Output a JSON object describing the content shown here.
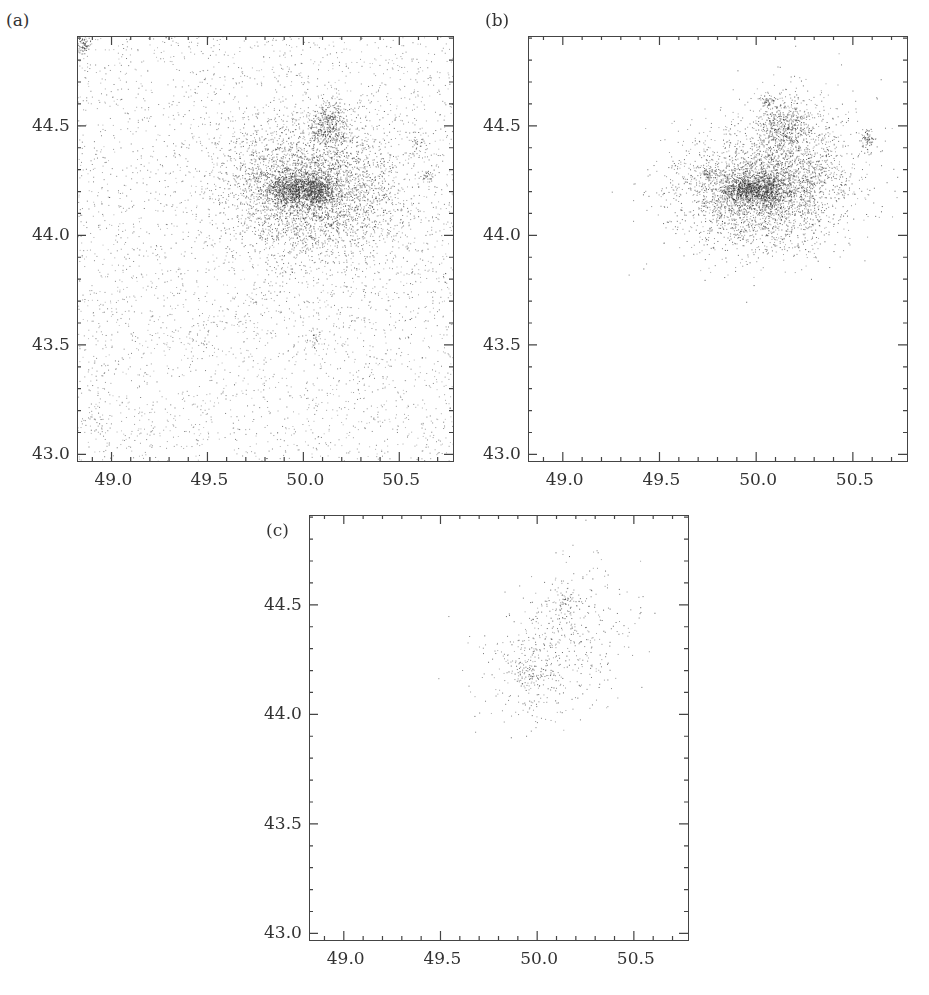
{
  "figure": {
    "panels": [
      {
        "id": "a",
        "label": "(a)"
      },
      {
        "id": "b",
        "label": "(b)"
      },
      {
        "id": "c",
        "label": "(c)"
      }
    ]
  },
  "chart_data": [
    {
      "type": "scatter",
      "panel_label": "(a)",
      "title": "",
      "xlabel": "",
      "ylabel": "",
      "xlim": [
        48.82,
        50.78
      ],
      "ylim": [
        42.97,
        44.91
      ],
      "x_ticks": [
        "49.0",
        "49.5",
        "50.0",
        "50.5"
      ],
      "y_ticks": [
        "43.0",
        "43.5",
        "44.0",
        "44.5"
      ],
      "grid": false,
      "density": "high",
      "n_points_approx": 9000,
      "background_fraction": 0.42,
      "clusters": [
        {
          "x": 50.05,
          "y": 44.21,
          "sx": 0.23,
          "sy": 0.16,
          "weight": 0.46
        },
        {
          "x": 49.92,
          "y": 44.21,
          "sx": 0.06,
          "sy": 0.04,
          "weight": 0.08
        },
        {
          "x": 50.06,
          "y": 44.21,
          "sx": 0.06,
          "sy": 0.04,
          "weight": 0.09
        },
        {
          "x": 50.13,
          "y": 44.51,
          "sx": 0.05,
          "sy": 0.05,
          "weight": 0.05
        },
        {
          "x": 48.85,
          "y": 44.87,
          "sx": 0.02,
          "sy": 0.02,
          "weight": 0.01
        },
        {
          "x": 49.75,
          "y": 44.28,
          "sx": 0.02,
          "sy": 0.02,
          "weight": 0.005
        },
        {
          "x": 50.65,
          "y": 44.27,
          "sx": 0.02,
          "sy": 0.02,
          "weight": 0.005
        },
        {
          "x": 50.6,
          "y": 44.43,
          "sx": 0.03,
          "sy": 0.03,
          "weight": 0.005
        },
        {
          "x": 50.05,
          "y": 43.52,
          "sx": 0.02,
          "sy": 0.02,
          "weight": 0.004
        },
        {
          "x": 49.45,
          "y": 43.54,
          "sx": 0.03,
          "sy": 0.03,
          "weight": 0.003
        },
        {
          "x": 48.93,
          "y": 43.16,
          "sx": 0.03,
          "sy": 0.03,
          "weight": 0.003
        }
      ]
    },
    {
      "type": "scatter",
      "panel_label": "(b)",
      "title": "",
      "xlabel": "",
      "ylabel": "",
      "xlim": [
        48.82,
        50.78
      ],
      "ylim": [
        42.97,
        44.91
      ],
      "x_ticks": [
        "49.0",
        "49.5",
        "50.0",
        "50.5"
      ],
      "y_ticks": [
        "43.0",
        "43.5",
        "44.0",
        "44.5"
      ],
      "grid": false,
      "density": "medium",
      "n_points_approx": 5200,
      "background_fraction": 0.0,
      "clusters": [
        {
          "x": 50.02,
          "y": 44.2,
          "sx": 0.22,
          "sy": 0.14,
          "weight": 0.55
        },
        {
          "x": 49.92,
          "y": 44.21,
          "sx": 0.05,
          "sy": 0.035,
          "weight": 0.1
        },
        {
          "x": 50.05,
          "y": 44.21,
          "sx": 0.06,
          "sy": 0.04,
          "weight": 0.12
        },
        {
          "x": 50.13,
          "y": 44.5,
          "sx": 0.06,
          "sy": 0.06,
          "weight": 0.07
        },
        {
          "x": 50.25,
          "y": 44.4,
          "sx": 0.15,
          "sy": 0.15,
          "weight": 0.12
        },
        {
          "x": 49.75,
          "y": 44.28,
          "sx": 0.015,
          "sy": 0.015,
          "weight": 0.01
        },
        {
          "x": 50.57,
          "y": 44.43,
          "sx": 0.02,
          "sy": 0.03,
          "weight": 0.015
        },
        {
          "x": 50.05,
          "y": 44.62,
          "sx": 0.02,
          "sy": 0.02,
          "weight": 0.01
        }
      ]
    },
    {
      "type": "scatter",
      "panel_label": "(c)",
      "title": "",
      "xlabel": "",
      "ylabel": "",
      "xlim": [
        48.82,
        50.78
      ],
      "ylim": [
        42.97,
        44.91
      ],
      "x_ticks": [
        "49.0",
        "49.5",
        "50.0",
        "50.5"
      ],
      "y_ticks": [
        "43.0",
        "43.5",
        "44.0",
        "44.5"
      ],
      "grid": false,
      "density": "low",
      "n_points_approx": 700,
      "background_fraction": 0.0,
      "clusters": [
        {
          "x": 50.02,
          "y": 44.22,
          "sx": 0.17,
          "sy": 0.13,
          "weight": 0.55
        },
        {
          "x": 49.96,
          "y": 44.17,
          "sx": 0.04,
          "sy": 0.03,
          "weight": 0.08
        },
        {
          "x": 50.13,
          "y": 44.51,
          "sx": 0.05,
          "sy": 0.05,
          "weight": 0.12
        },
        {
          "x": 50.25,
          "y": 44.45,
          "sx": 0.15,
          "sy": 0.14,
          "weight": 0.25
        }
      ]
    }
  ]
}
